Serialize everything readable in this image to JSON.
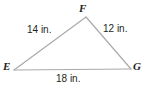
{
  "figure": {
    "kind": "triangle-diagram",
    "background_color": "#ffffff",
    "stroke_color": "#a7a9ac",
    "text_color": "#231f20",
    "unit": "in.",
    "vertices": [
      {
        "id": "F",
        "label": "F",
        "x": 86,
        "y": 17
      },
      {
        "id": "E",
        "label": "E",
        "x": 14,
        "y": 70
      },
      {
        "id": "G",
        "label": "G",
        "x": 131,
        "y": 69
      }
    ],
    "sides": [
      {
        "id": "EF",
        "label": "14 in.",
        "length": 14,
        "from": "E",
        "to": "F"
      },
      {
        "id": "FG",
        "label": "12 in.",
        "length": 12,
        "from": "F",
        "to": "G"
      },
      {
        "id": "EG",
        "label": "18 in.",
        "length": 18,
        "from": "E",
        "to": "G"
      }
    ]
  }
}
